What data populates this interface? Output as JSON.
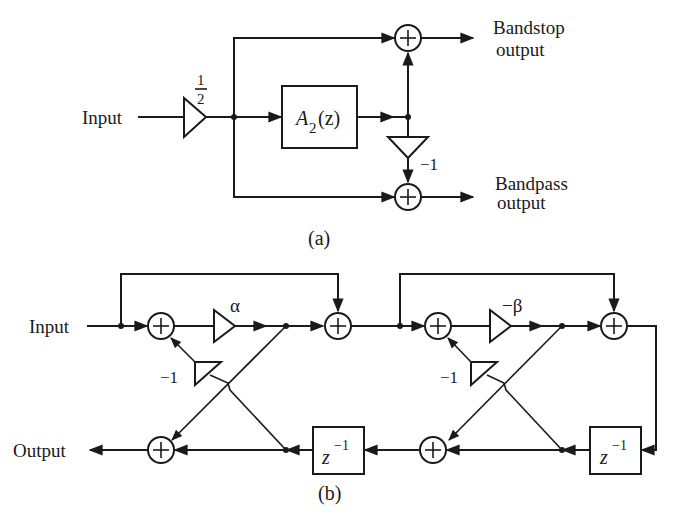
{
  "figure_a": {
    "caption": "(a)",
    "input_label": "Input",
    "gain_label_num": "1",
    "gain_label_den": "2",
    "allpass_block": {
      "base": "A",
      "sub": "2",
      "arg": "(z)"
    },
    "inverter_gain": "−1",
    "adder_symbol": "+",
    "bandstop_label_line1": "Bandstop",
    "bandstop_label_line2": "output",
    "bandpass_label_line1": "Bandpass",
    "bandpass_label_line2": "output"
  },
  "figure_b": {
    "caption": "(b)",
    "input_label": "Input",
    "output_label": "Output",
    "stage1_gain": "α",
    "stage2_gain": "−β",
    "inverter_gain_1": "−1",
    "inverter_gain_2": "−1",
    "delay_base": "z",
    "delay_exp": "−1",
    "adder_symbol": "+"
  }
}
